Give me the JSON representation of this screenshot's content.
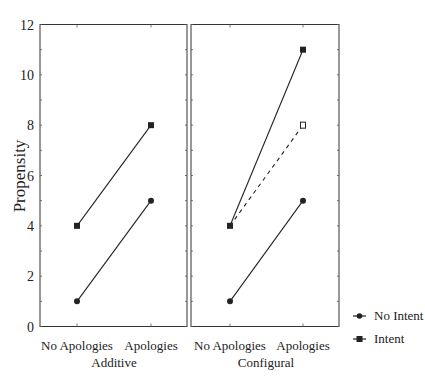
{
  "chart_data": [
    {
      "type": "line",
      "panel": "Additive",
      "xlabel": "Additive",
      "ylabel": "Propensity",
      "categories": [
        "No Apologies",
        "Apologies"
      ],
      "ylim": [
        0,
        12
      ],
      "yticks": [
        0,
        2,
        4,
        6,
        8,
        10,
        12
      ],
      "series": [
        {
          "name": "No Intent",
          "marker": "circle",
          "style": "solid",
          "values": [
            1,
            5
          ]
        },
        {
          "name": "Intent",
          "marker": "square",
          "style": "solid",
          "values": [
            4,
            8
          ]
        }
      ]
    },
    {
      "type": "line",
      "panel": "Configural",
      "xlabel": "Configural",
      "ylabel": "Propensity",
      "categories": [
        "No Apologies",
        "Apologies"
      ],
      "ylim": [
        0,
        12
      ],
      "yticks": [
        0,
        2,
        4,
        6,
        8,
        10,
        12
      ],
      "series": [
        {
          "name": "No Intent",
          "marker": "circle",
          "style": "solid",
          "values": [
            1,
            5
          ]
        },
        {
          "name": "Intent",
          "marker": "square",
          "style": "solid",
          "values": [
            4,
            11
          ]
        },
        {
          "name": "Intent (additive reference)",
          "marker": "open-square",
          "style": "dashed",
          "values": [
            4,
            8
          ]
        }
      ]
    }
  ],
  "axis": {
    "ylabel": "Propensity",
    "yticks": [
      "0",
      "2",
      "4",
      "6",
      "8",
      "10",
      "12"
    ],
    "categories": [
      "No Apologies",
      "Apologies"
    ],
    "panels": [
      "Additive",
      "Configural"
    ]
  },
  "legend": {
    "items": [
      {
        "label": "No Intent",
        "marker": "circle"
      },
      {
        "label": "Intent",
        "marker": "square"
      }
    ]
  },
  "colors": {
    "line": "#222222",
    "frame": "#333333"
  }
}
